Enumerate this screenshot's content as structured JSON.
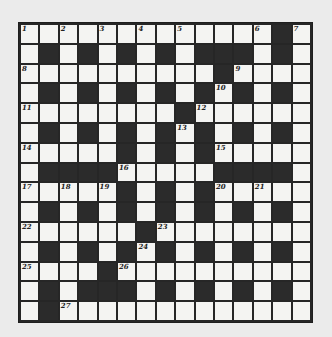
{
  "puzzle": {
    "rows": 15,
    "cols": 15,
    "grid": [
      "WWWWWWWWWWWWWBW",
      "WBWBWBWBWBBBWBW",
      "WWWWWWWWWWBWWWW",
      "WBWBWBWBWBWBWBW",
      "WWWWWWWWBWWWWWW",
      "WBWBWBWBWBWBWBW",
      "WWWWWBWBWBWWWWW",
      "WBBBBWWWWWBBBBW",
      "WWWWWBWBWBWWWWW",
      "WBWBWBWBWBWBWBW",
      "WWWWWWBWWWWWWWW",
      "WBWBWBWBWBWBWBW",
      "WWWWBWWWWWWWWWW",
      "WBWBBBWBWBWBWBW",
      "WBWWWWWWWWWWWWW"
    ],
    "numbers": [
      {
        "n": "1",
        "r": 0,
        "c": 0
      },
      {
        "n": "2",
        "r": 0,
        "c": 2
      },
      {
        "n": "3",
        "r": 0,
        "c": 4
      },
      {
        "n": "4",
        "r": 0,
        "c": 6
      },
      {
        "n": "5",
        "r": 0,
        "c": 8
      },
      {
        "n": "6",
        "r": 0,
        "c": 12
      },
      {
        "n": "7",
        "r": 0,
        "c": 14
      },
      {
        "n": "8",
        "r": 2,
        "c": 0
      },
      {
        "n": "9",
        "r": 2,
        "c": 11
      },
      {
        "n": "10",
        "r": 3,
        "c": 10
      },
      {
        "n": "11",
        "r": 4,
        "c": 0
      },
      {
        "n": "12",
        "r": 4,
        "c": 9
      },
      {
        "n": "13",
        "r": 5,
        "c": 8
      },
      {
        "n": "14",
        "r": 6,
        "c": 0
      },
      {
        "n": "15",
        "r": 6,
        "c": 10
      },
      {
        "n": "16",
        "r": 7,
        "c": 5
      },
      {
        "n": "17",
        "r": 8,
        "c": 0
      },
      {
        "n": "18",
        "r": 8,
        "c": 2
      },
      {
        "n": "19",
        "r": 8,
        "c": 4
      },
      {
        "n": "20",
        "r": 8,
        "c": 10
      },
      {
        "n": "21",
        "r": 8,
        "c": 12
      },
      {
        "n": "22",
        "r": 10,
        "c": 0
      },
      {
        "n": "23",
        "r": 10,
        "c": 7
      },
      {
        "n": "24",
        "r": 11,
        "c": 6
      },
      {
        "n": "25",
        "r": 12,
        "c": 0
      },
      {
        "n": "26",
        "r": 12,
        "c": 5
      },
      {
        "n": "27",
        "r": 14,
        "c": 2
      }
    ]
  },
  "colors": {
    "background": "#ebebeb",
    "white_cell": "#f4f4f2",
    "black_cell": "#2b2b2b",
    "grid_line": "#262626"
  }
}
